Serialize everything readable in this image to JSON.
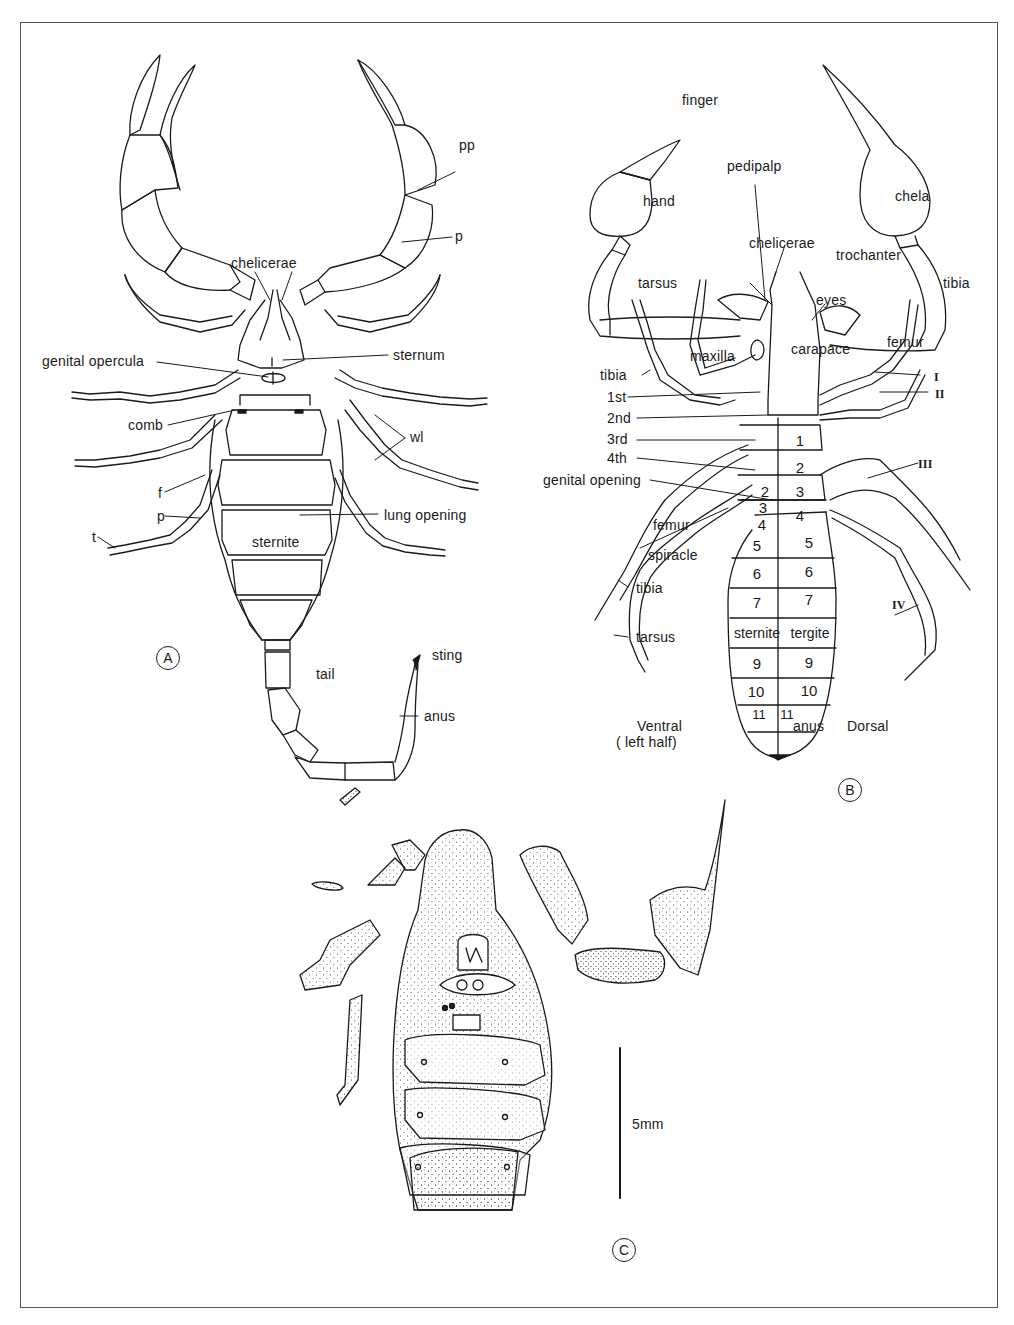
{
  "figure": {
    "colors": {
      "line": "#1a1a1a",
      "border": "#555555",
      "background": "#ffffff",
      "stipple": "#333333"
    }
  },
  "panels": {
    "A": {
      "letter": "A",
      "labels": {
        "pp": "pp",
        "p_upper": "p",
        "chelicerae": "chelicerae",
        "genital_opercula": "genital opercula",
        "sternum": "sternum",
        "comb": "comb",
        "wl": "wl",
        "f": "f",
        "p_lower": "p",
        "t": "t",
        "lung_opening": "lung opening",
        "sternite": "sternite",
        "tail": "tail",
        "sting": "sting",
        "anus": "anus"
      }
    },
    "B": {
      "letter": "B",
      "labels": {
        "finger": "finger",
        "pedipalp": "pedipalp",
        "hand": "hand",
        "chela": "chela",
        "chelicerae": "chelicerae",
        "trochanter": "trochanter",
        "tibia_right": "tibia",
        "tarsus_upper": "tarsus",
        "eyes": "eyes",
        "maxilla": "maxilla",
        "carapace": "carapace",
        "femur_right": "femur",
        "tibia_left": "tibia",
        "leg_I": "I",
        "leg_II": "II",
        "leg_III": "III",
        "leg_IV": "IV",
        "first": "1st",
        "second": "2nd",
        "third": "3rd",
        "fourth": "4th",
        "genital_opening": "genital opening",
        "femur_left": "femur",
        "spiracle": "spiracle",
        "tibia_lower": "tibia",
        "tarsus_lower": "tarsus",
        "ventral": "Ventral",
        "left_half": "( left half)",
        "anus": "anus",
        "dorsal": "Dorsal"
      },
      "ventral_segments": [
        "2",
        "3",
        "4",
        "5",
        "6",
        "7",
        "sternite",
        "9",
        "10",
        "11"
      ],
      "dorsal_segments": [
        "1",
        "2",
        "3",
        "4",
        "5",
        "6",
        "7",
        "tergite",
        "9",
        "10",
        "11"
      ]
    },
    "C": {
      "letter": "C",
      "scale_bar_label": "5mm"
    }
  }
}
